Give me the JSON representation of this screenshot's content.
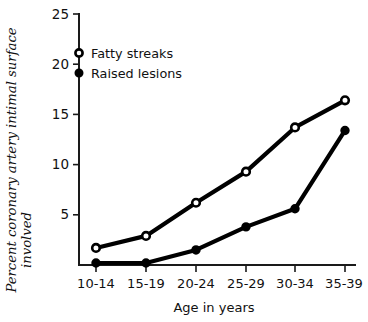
{
  "chart_data": {
    "type": "line",
    "title": "",
    "xlabel": "Age in years",
    "ylabel": "Percent coronary artery intimal surface involved",
    "ylabel_line1": "Percent coronary artery intimal surface",
    "ylabel_line2": "involved",
    "categories": [
      "10-14",
      "15-19",
      "20-24",
      "25-29",
      "30-34",
      "35-39"
    ],
    "series": [
      {
        "name": "Fatty streaks",
        "marker": "open-circle",
        "values": [
          1.7,
          2.9,
          6.2,
          9.3,
          13.7,
          16.4
        ]
      },
      {
        "name": "Raised lesions",
        "marker": "filled-circle",
        "values": [
          0.2,
          0.2,
          1.5,
          3.8,
          5.6,
          13.4
        ]
      }
    ],
    "ylim": [
      0,
      25
    ],
    "yticks": [
      5,
      10,
      15,
      20,
      25
    ],
    "ytick_labels": [
      "5",
      "10",
      "15",
      "20",
      "25"
    ],
    "grid": false,
    "legend_position": "upper-left-inside",
    "colors": {
      "line": "#000000",
      "axis": "#1a1a1a",
      "background": "#ffffff"
    }
  },
  "legend": {
    "items": [
      {
        "label": "Fatty streaks",
        "marker": "open-circle"
      },
      {
        "label": "Raised lesions",
        "marker": "filled-circle"
      }
    ]
  }
}
